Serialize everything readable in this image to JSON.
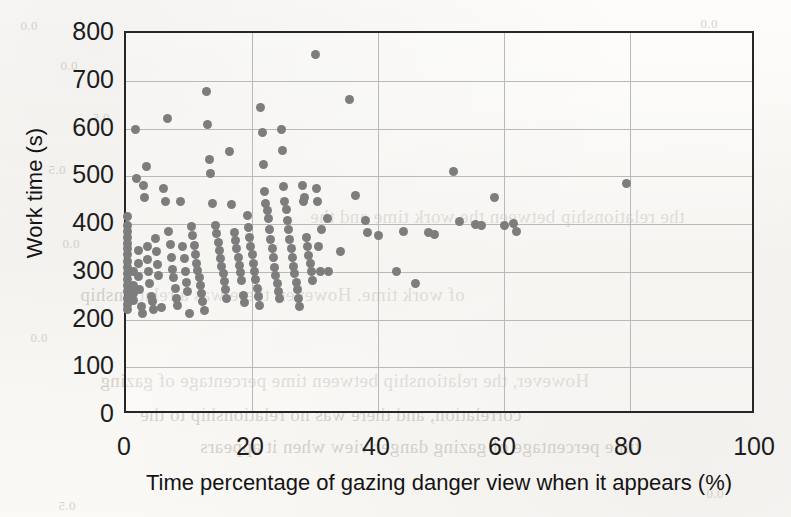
{
  "chart_data": {
    "type": "scatter",
    "title": "",
    "xlabel": "Time percentage of gazing danger view when it appears (%)",
    "ylabel": "Work time (s)",
    "xlim": [
      0,
      100
    ],
    "ylim": [
      0,
      800
    ],
    "xticks": [
      0,
      20,
      40,
      60,
      80,
      100
    ],
    "yticks": [
      0,
      100,
      200,
      300,
      400,
      500,
      600,
      700,
      800
    ],
    "xtick_labels": [
      "0",
      "20",
      "40",
      "60",
      "80",
      "100"
    ],
    "ytick_labels": [
      "0",
      "100",
      "200",
      "300",
      "400",
      "500",
      "600",
      "700",
      "800"
    ],
    "grid": true,
    "grid_color": "#b9b9b9",
    "marker_color": "#7d7d7d",
    "axis_color": "#262626",
    "legend": null,
    "legend_position": "none",
    "marker": "circle",
    "marker_size": 9,
    "points": [
      [
        0.3,
        415
      ],
      [
        0.3,
        398
      ],
      [
        0.3,
        385
      ],
      [
        0.3,
        372
      ],
      [
        0.3,
        360
      ],
      [
        0.3,
        348
      ],
      [
        0.3,
        336
      ],
      [
        0.3,
        322
      ],
      [
        0.3,
        308
      ],
      [
        0.3,
        296
      ],
      [
        0.3,
        284
      ],
      [
        0.3,
        272
      ],
      [
        0.3,
        258
      ],
      [
        0.3,
        244
      ],
      [
        0.3,
        232
      ],
      [
        0.3,
        221
      ],
      [
        1.2,
        300
      ],
      [
        1.2,
        272
      ],
      [
        1.2,
        255
      ],
      [
        1.2,
        240
      ],
      [
        1.5,
        598
      ],
      [
        1.6,
        495
      ],
      [
        2.0,
        345
      ],
      [
        2.0,
        318
      ],
      [
        2.0,
        290
      ],
      [
        2.2,
        262
      ],
      [
        2.4,
        228
      ],
      [
        2.6,
        212
      ],
      [
        2.8,
        480
      ],
      [
        3.0,
        455
      ],
      [
        3.2,
        520
      ],
      [
        3.4,
        352
      ],
      [
        3.4,
        325
      ],
      [
        3.6,
        300
      ],
      [
        3.8,
        276
      ],
      [
        4.0,
        248
      ],
      [
        4.2,
        238
      ],
      [
        4.4,
        222
      ],
      [
        4.6,
        370
      ],
      [
        4.8,
        342
      ],
      [
        5.0,
        315
      ],
      [
        5.2,
        292
      ],
      [
        5.6,
        226
      ],
      [
        6.0,
        475
      ],
      [
        6.3,
        448
      ],
      [
        6.6,
        620
      ],
      [
        6.8,
        385
      ],
      [
        7.0,
        358
      ],
      [
        7.2,
        330
      ],
      [
        7.4,
        305
      ],
      [
        7.6,
        288
      ],
      [
        7.8,
        265
      ],
      [
        8.0,
        245
      ],
      [
        8.2,
        230
      ],
      [
        8.6,
        448
      ],
      [
        9.0,
        352
      ],
      [
        9.2,
        328
      ],
      [
        9.4,
        300
      ],
      [
        9.6,
        278
      ],
      [
        9.8,
        258
      ],
      [
        10.0,
        212
      ],
      [
        10.4,
        395
      ],
      [
        10.6,
        375
      ],
      [
        10.8,
        355
      ],
      [
        11.0,
        336
      ],
      [
        11.2,
        318
      ],
      [
        11.4,
        302
      ],
      [
        11.6,
        288
      ],
      [
        11.8,
        272
      ],
      [
        12.0,
        255
      ],
      [
        12.2,
        238
      ],
      [
        12.4,
        218
      ],
      [
        12.8,
        678
      ],
      [
        13.0,
        608
      ],
      [
        13.2,
        535
      ],
      [
        13.4,
        505
      ],
      [
        13.8,
        442
      ],
      [
        14.2,
        398
      ],
      [
        14.4,
        380
      ],
      [
        14.6,
        362
      ],
      [
        14.8,
        344
      ],
      [
        15.0,
        328
      ],
      [
        15.2,
        312
      ],
      [
        15.4,
        296
      ],
      [
        15.6,
        280
      ],
      [
        15.8,
        262
      ],
      [
        16.0,
        244
      ],
      [
        16.4,
        552
      ],
      [
        16.8,
        440
      ],
      [
        17.2,
        382
      ],
      [
        17.4,
        366
      ],
      [
        17.6,
        348
      ],
      [
        17.8,
        330
      ],
      [
        18.0,
        314
      ],
      [
        18.2,
        298
      ],
      [
        18.4,
        282
      ],
      [
        18.6,
        250
      ],
      [
        18.8,
        236
      ],
      [
        19.2,
        418
      ],
      [
        19.4,
        392
      ],
      [
        19.6,
        372
      ],
      [
        19.8,
        352
      ],
      [
        20.0,
        336
      ],
      [
        20.2,
        318
      ],
      [
        20.4,
        300
      ],
      [
        20.6,
        284
      ],
      [
        20.8,
        266
      ],
      [
        21.0,
        248
      ],
      [
        21.2,
        230
      ],
      [
        21.4,
        645
      ],
      [
        21.6,
        592
      ],
      [
        21.8,
        525
      ],
      [
        22.0,
        468
      ],
      [
        22.2,
        442
      ],
      [
        22.4,
        428
      ],
      [
        22.6,
        412
      ],
      [
        22.8,
        388
      ],
      [
        23.0,
        368
      ],
      [
        23.2,
        348
      ],
      [
        23.4,
        330
      ],
      [
        23.6,
        310
      ],
      [
        23.8,
        292
      ],
      [
        24.0,
        275
      ],
      [
        24.2,
        258
      ],
      [
        24.4,
        244
      ],
      [
        24.6,
        598
      ],
      [
        24.8,
        555
      ],
      [
        25.0,
        478
      ],
      [
        25.2,
        448
      ],
      [
        25.4,
        430
      ],
      [
        25.6,
        408
      ],
      [
        25.8,
        388
      ],
      [
        26.0,
        368
      ],
      [
        26.2,
        348
      ],
      [
        26.4,
        330
      ],
      [
        26.6,
        312
      ],
      [
        26.8,
        296
      ],
      [
        27.0,
        278
      ],
      [
        27.2,
        262
      ],
      [
        27.4,
        245
      ],
      [
        27.6,
        228
      ],
      [
        28.0,
        480
      ],
      [
        28.2,
        448
      ],
      [
        28.4,
        456
      ],
      [
        28.6,
        372
      ],
      [
        28.8,
        352
      ],
      [
        29.0,
        335
      ],
      [
        29.2,
        318
      ],
      [
        29.4,
        300
      ],
      [
        29.6,
        282
      ],
      [
        30.0,
        755
      ],
      [
        30.2,
        474
      ],
      [
        30.4,
        448
      ],
      [
        30.6,
        352
      ],
      [
        30.8,
        300
      ],
      [
        31.0,
        388
      ],
      [
        32.0,
        412
      ],
      [
        32.2,
        300
      ],
      [
        34.0,
        342
      ],
      [
        35.5,
        660
      ],
      [
        36.5,
        460
      ],
      [
        38.0,
        408
      ],
      [
        38.4,
        382
      ],
      [
        40.0,
        375
      ],
      [
        43.0,
        300
      ],
      [
        44.0,
        385
      ],
      [
        46.0,
        275
      ],
      [
        48.0,
        382
      ],
      [
        49.0,
        378
      ],
      [
        52.0,
        510
      ],
      [
        53.0,
        405
      ],
      [
        55.5,
        400
      ],
      [
        56.5,
        398
      ],
      [
        58.5,
        455
      ],
      [
        60.0,
        398
      ],
      [
        61.5,
        402
      ],
      [
        62.0,
        385
      ],
      [
        79.5,
        485
      ]
    ]
  },
  "bleed_text": [
    {
      "text": "0.0",
      "x": 20,
      "y": 18,
      "size": 13
    },
    {
      "text": "0.0",
      "x": 700,
      "y": 16,
      "size": 13
    },
    {
      "text": "0.0",
      "x": 60,
      "y": 58,
      "size": 13
    },
    {
      "text": "0.5",
      "x": 92,
      "y": 110,
      "size": 13
    },
    {
      "text": "0.5",
      "x": 48,
      "y": 162,
      "size": 13
    },
    {
      "text": "the relationship between the work time and the",
      "x": 310,
      "y": 206,
      "size": 19
    },
    {
      "text": "0.0",
      "x": 62,
      "y": 236,
      "size": 13
    },
    {
      "text": "of work time. However, there was a relationship",
      "x": 80,
      "y": 284,
      "size": 19
    },
    {
      "text": "0.0",
      "x": 30,
      "y": 330,
      "size": 13
    },
    {
      "text": "However, the relationship between time percentage of gazing",
      "x": 100,
      "y": 370,
      "size": 19
    },
    {
      "text": "correlation, and there was no relationship to the",
      "x": 140,
      "y": 404,
      "size": 19
    },
    {
      "text": "time percentage of gazing danger view when it appears",
      "x": 200,
      "y": 436,
      "size": 19
    },
    {
      "text": "0.0",
      "x": 706,
      "y": 486,
      "size": 13
    },
    {
      "text": "0.5",
      "x": 58,
      "y": 498,
      "size": 13
    }
  ]
}
